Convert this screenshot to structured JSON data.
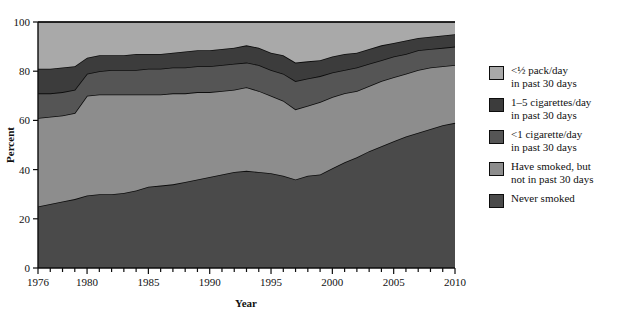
{
  "chart_data": {
    "type": "area",
    "stacked": true,
    "title": "",
    "xlabel": "Year",
    "ylabel": "Percent",
    "xlim": [
      1976,
      2010
    ],
    "ylim": [
      0,
      100
    ],
    "grid": false,
    "legend_position": "right",
    "x_major_ticks": [
      1976,
      1980,
      1985,
      1990,
      1995,
      2000,
      2005,
      2010
    ],
    "x_tick_labels": [
      "1976",
      "1980",
      "1985",
      "1990",
      "1995",
      "2000",
      "2005",
      "2010"
    ],
    "x_minor_tick_step": 1,
    "y_ticks": [
      0,
      20,
      40,
      60,
      80,
      100
    ],
    "y_tick_labels": [
      "0",
      "20",
      "40",
      "60",
      "80",
      "100"
    ],
    "x": [
      1976,
      1977,
      1978,
      1979,
      1980,
      1981,
      1982,
      1983,
      1984,
      1985,
      1986,
      1987,
      1988,
      1989,
      1990,
      1991,
      1992,
      1993,
      1994,
      1995,
      1996,
      1997,
      1998,
      1999,
      2000,
      2001,
      2002,
      2003,
      2004,
      2005,
      2006,
      2007,
      2008,
      2009,
      2010
    ],
    "series": [
      {
        "name": "Never smoked",
        "legend_label": "Never smoked",
        "color": "#4a4a4a",
        "values": [
          25,
          26,
          27,
          28,
          29.5,
          30,
          30,
          30.5,
          31.5,
          33,
          33.5,
          34,
          35,
          36,
          37,
          38,
          39,
          39.5,
          39,
          38.5,
          37.5,
          36,
          37.5,
          38,
          40.5,
          43,
          45,
          47.5,
          49.5,
          51.5,
          53.5,
          55,
          56.5,
          58,
          59
        ]
      },
      {
        "name": "Have smoked, but not in past 30 days",
        "legend_label": "Have smoked, but\nnot in past 30 days",
        "color": "#8d8d8d",
        "values": [
          36,
          35.5,
          35,
          35,
          40.5,
          40.5,
          40.5,
          40,
          39,
          37.5,
          37,
          37,
          36,
          35.5,
          34.5,
          34,
          33.5,
          34,
          33,
          31.5,
          30.5,
          28.5,
          28.5,
          29.5,
          29,
          28,
          27,
          26.5,
          26.5,
          26,
          25.5,
          25.5,
          25,
          24,
          23.5
        ]
      },
      {
        "name": "<1 cigarette/day in past 30 days",
        "legend_label": "<1 cigarette/day\nin past 30 days",
        "color": "#555555",
        "values": [
          10,
          9.5,
          9.5,
          9.5,
          9,
          9.5,
          10,
          10,
          10,
          10.5,
          10.5,
          10.5,
          10.5,
          10.5,
          10.5,
          10.5,
          10.5,
          10,
          10.5,
          10.5,
          11,
          11.5,
          11,
          10.5,
          10,
          9.5,
          9.5,
          9,
          8.5,
          8.5,
          8,
          8,
          7.5,
          7.5,
          7.5
        ]
      },
      {
        "name": "1–5 cigarettes/day in past 30 days",
        "legend_label": "1–5 cigarettes/day\nin past 30 days",
        "color": "#3c3c3c",
        "values": [
          10,
          10,
          10,
          9.5,
          6.5,
          6.5,
          6,
          6,
          6.5,
          6,
          6,
          6,
          6.5,
          6.5,
          6.5,
          6.5,
          6.5,
          7,
          7,
          7,
          7.5,
          7.5,
          7,
          6.5,
          6.5,
          6.5,
          6,
          6,
          6,
          5.5,
          5.5,
          5,
          5,
          5,
          5
        ]
      },
      {
        "name": "<1/2 pack/day in past 30 days",
        "legend_label": "<½ pack/day\nin past 30 days",
        "color": "#a9a9a9",
        "values": [
          19,
          19,
          18.5,
          18,
          14.5,
          13.5,
          13.5,
          13.5,
          13,
          13,
          13,
          12.5,
          12,
          11.5,
          11.5,
          11,
          10.5,
          9.5,
          10.5,
          12.5,
          13.5,
          16.5,
          16,
          15.5,
          14,
          13,
          12.5,
          11,
          9.5,
          8.5,
          7.5,
          6.5,
          6,
          5.5,
          5
        ]
      }
    ],
    "legend_entries": [
      {
        "label": "<½ pack/day\nin past 30 days",
        "color": "#a9a9a9"
      },
      {
        "label": "1–5 cigarettes/day\nin past 30 days",
        "color": "#3c3c3c"
      },
      {
        "label": "<1 cigarette/day\nin past 30 days",
        "color": "#555555"
      },
      {
        "label": "Have smoked, but\nnot in past 30 days",
        "color": "#8d8d8d"
      },
      {
        "label": "Never smoked",
        "color": "#4a4a4a"
      }
    ],
    "outline_color": "#0d0d0d",
    "background": "#ffffff"
  }
}
